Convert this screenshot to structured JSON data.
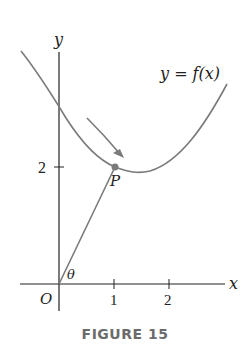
{
  "figure": {
    "caption": "FIGURE 15",
    "curve_label": "y = f(x)",
    "x_axis_label": "x",
    "y_axis_label": "y",
    "origin_label": "O",
    "point_label": "P",
    "angle_label": "θ",
    "x_ticks": [
      "1",
      "2"
    ],
    "y_ticks": [
      "2"
    ],
    "colors": {
      "axis": "#222222",
      "curve": "#7a7a7a",
      "segment": "#7a7a7a",
      "point": "#7a7a7a",
      "caption": "#6b6b6b"
    }
  }
}
